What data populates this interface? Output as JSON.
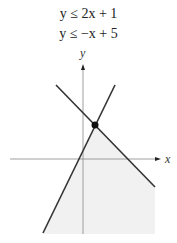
{
  "equations": [
    {
      "text": "y ≤ 2x + 1"
    },
    {
      "text": "y ≤ −x + 5"
    }
  ],
  "graph": {
    "x_axis_label": "x",
    "y_axis_label": "y",
    "lines": [
      {
        "name": "y = 2x + 1",
        "color": "#333333"
      },
      {
        "name": "y = -x + 5",
        "color": "#333333"
      }
    ],
    "intersection_point": {
      "label": "(4/3, 11/3)"
    },
    "shaded_region_color": "#f2f2f2"
  }
}
